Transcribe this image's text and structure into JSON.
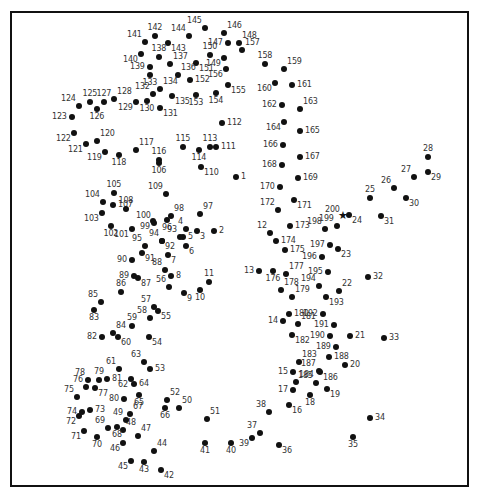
{
  "colors": {
    "dot": "#111111",
    "label": "#333333",
    "border": "#111111",
    "background": "#ffffff"
  },
  "start_marker": {
    "number": "200",
    "icon": "star-icon",
    "glyph": "★"
  },
  "points": [
    {
      "n": "1",
      "x": 236,
      "y": 177,
      "lp": "r"
    },
    {
      "n": "2",
      "x": 214,
      "y": 231,
      "lp": "r"
    },
    {
      "n": "3",
      "x": 197,
      "y": 231,
      "lp": "br"
    },
    {
      "n": "4",
      "x": 186,
      "y": 229,
      "lp": "tl"
    },
    {
      "n": "5",
      "x": 183,
      "y": 237,
      "lp": "r"
    },
    {
      "n": "6",
      "x": 186,
      "y": 246,
      "lp": "br"
    },
    {
      "n": "7",
      "x": 168,
      "y": 255,
      "lp": "br"
    },
    {
      "n": "8",
      "x": 171,
      "y": 276,
      "lp": "r"
    },
    {
      "n": "9",
      "x": 184,
      "y": 293,
      "lp": "br"
    },
    {
      "n": "10",
      "x": 200,
      "y": 290,
      "lp": "b"
    },
    {
      "n": "11",
      "x": 209,
      "y": 282,
      "lp": "t"
    },
    {
      "n": "12",
      "x": 270,
      "y": 233,
      "lp": "tl"
    },
    {
      "n": "13",
      "x": 259,
      "y": 271,
      "lp": "l"
    },
    {
      "n": "14",
      "x": 283,
      "y": 321,
      "lp": "l"
    },
    {
      "n": "15",
      "x": 293,
      "y": 372,
      "lp": "l"
    },
    {
      "n": "16",
      "x": 289,
      "y": 405,
      "lp": "br"
    },
    {
      "n": "17",
      "x": 293,
      "y": 390,
      "lp": "l"
    },
    {
      "n": "18",
      "x": 310,
      "y": 395,
      "lp": "b"
    },
    {
      "n": "19",
      "x": 327,
      "y": 389,
      "lp": "br"
    },
    {
      "n": "20",
      "x": 345,
      "y": 365,
      "lp": "r"
    },
    {
      "n": "21",
      "x": 350,
      "y": 336,
      "lp": "r"
    },
    {
      "n": "22",
      "x": 339,
      "y": 291,
      "lp": "tr"
    },
    {
      "n": "23",
      "x": 338,
      "y": 249,
      "lp": "br"
    },
    {
      "n": "24",
      "x": 349,
      "y": 215,
      "lp": "br"
    },
    {
      "n": "25",
      "x": 370,
      "y": 198,
      "lp": "t"
    },
    {
      "n": "26",
      "x": 394,
      "y": 188,
      "lp": "tl"
    },
    {
      "n": "27",
      "x": 414,
      "y": 177,
      "lp": "tl"
    },
    {
      "n": "28",
      "x": 428,
      "y": 157,
      "lp": "t"
    },
    {
      "n": "29",
      "x": 428,
      "y": 172,
      "lp": "br"
    },
    {
      "n": "30",
      "x": 406,
      "y": 198,
      "lp": "br"
    },
    {
      "n": "31",
      "x": 381,
      "y": 216,
      "lp": "br"
    },
    {
      "n": "32",
      "x": 368,
      "y": 277,
      "lp": "r"
    },
    {
      "n": "33",
      "x": 384,
      "y": 338,
      "lp": "r"
    },
    {
      "n": "34",
      "x": 370,
      "y": 418,
      "lp": "r"
    },
    {
      "n": "35",
      "x": 353,
      "y": 437,
      "lp": "b"
    },
    {
      "n": "36",
      "x": 279,
      "y": 445,
      "lp": "br"
    },
    {
      "n": "37",
      "x": 260,
      "y": 433,
      "lp": "tl"
    },
    {
      "n": "38",
      "x": 269,
      "y": 412,
      "lp": "tl"
    },
    {
      "n": "39",
      "x": 252,
      "y": 438,
      "lp": "bl"
    },
    {
      "n": "40",
      "x": 231,
      "y": 443,
      "lp": "b"
    },
    {
      "n": "41",
      "x": 205,
      "y": 443,
      "lp": "b"
    },
    {
      "n": "42",
      "x": 161,
      "y": 470,
      "lp": "br"
    },
    {
      "n": "43",
      "x": 144,
      "y": 462,
      "lp": "b"
    },
    {
      "n": "44",
      "x": 154,
      "y": 451,
      "lp": "tr"
    },
    {
      "n": "45",
      "x": 131,
      "y": 461,
      "lp": "bl"
    },
    {
      "n": "46",
      "x": 123,
      "y": 443,
      "lp": "bl"
    },
    {
      "n": "47",
      "x": 138,
      "y": 436,
      "lp": "tr"
    },
    {
      "n": "48",
      "x": 123,
      "y": 430,
      "lp": "tr"
    },
    {
      "n": "49",
      "x": 126,
      "y": 420,
      "lp": "tl"
    },
    {
      "n": "50",
      "x": 179,
      "y": 408,
      "lp": "tr"
    },
    {
      "n": "51",
      "x": 207,
      "y": 419,
      "lp": "tr"
    },
    {
      "n": "52",
      "x": 167,
      "y": 400,
      "lp": "tr"
    },
    {
      "n": "53",
      "x": 150,
      "y": 369,
      "lp": "r"
    },
    {
      "n": "54",
      "x": 149,
      "y": 337,
      "lp": "br"
    },
    {
      "n": "55",
      "x": 158,
      "y": 311,
      "lp": "br"
    },
    {
      "n": "56",
      "x": 169,
      "y": 287,
      "lp": "tl"
    },
    {
      "n": "57",
      "x": 154,
      "y": 307,
      "lp": "tl"
    },
    {
      "n": "58",
      "x": 150,
      "y": 318,
      "lp": "tl"
    },
    {
      "n": "59",
      "x": 132,
      "y": 326,
      "lp": "t"
    },
    {
      "n": "60",
      "x": 118,
      "y": 337,
      "lp": "br"
    },
    {
      "n": "61",
      "x": 119,
      "y": 369,
      "lp": "tl"
    },
    {
      "n": "62",
      "x": 131,
      "y": 379,
      "lp": "bl"
    },
    {
      "n": "63",
      "x": 144,
      "y": 362,
      "lp": "tl"
    },
    {
      "n": "64",
      "x": 134,
      "y": 384,
      "lp": "r"
    },
    {
      "n": "65",
      "x": 139,
      "y": 395,
      "lp": "b"
    },
    {
      "n": "66",
      "x": 165,
      "y": 408,
      "lp": "b"
    },
    {
      "n": "67",
      "x": 130,
      "y": 414,
      "lp": "tr"
    },
    {
      "n": "68",
      "x": 117,
      "y": 427,
      "lp": "b"
    },
    {
      "n": "69",
      "x": 108,
      "y": 428,
      "lp": "tl"
    },
    {
      "n": "70",
      "x": 97,
      "y": 437,
      "lp": "b"
    },
    {
      "n": "71",
      "x": 84,
      "y": 431,
      "lp": "bl"
    },
    {
      "n": "72",
      "x": 79,
      "y": 416,
      "lp": "bl"
    },
    {
      "n": "73",
      "x": 90,
      "y": 410,
      "lp": "r"
    },
    {
      "n": "74",
      "x": 82,
      "y": 412,
      "lp": "l"
    },
    {
      "n": "75",
      "x": 77,
      "y": 397,
      "lp": "tl"
    },
    {
      "n": "76",
      "x": 86,
      "y": 387,
      "lp": "tl"
    },
    {
      "n": "77",
      "x": 95,
      "y": 388,
      "lp": "br"
    },
    {
      "n": "78",
      "x": 88,
      "y": 380,
      "lp": "tl"
    },
    {
      "n": "79",
      "x": 99,
      "y": 380,
      "lp": "t"
    },
    {
      "n": "80",
      "x": 124,
      "y": 399,
      "lp": "l"
    },
    {
      "n": "81",
      "x": 107,
      "y": 379,
      "lp": "r"
    },
    {
      "n": "82",
      "x": 102,
      "y": 337,
      "lp": "l"
    },
    {
      "n": "83",
      "x": 94,
      "y": 310,
      "lp": "b"
    },
    {
      "n": "84",
      "x": 113,
      "y": 333,
      "lp": "tr"
    },
    {
      "n": "85",
      "x": 101,
      "y": 302,
      "lp": "tl"
    },
    {
      "n": "86",
      "x": 121,
      "y": 292,
      "lp": "t"
    },
    {
      "n": "87",
      "x": 138,
      "y": 278,
      "lp": "br"
    },
    {
      "n": "88",
      "x": 165,
      "y": 270,
      "lp": "tl"
    },
    {
      "n": "89",
      "x": 134,
      "y": 276,
      "lp": "l"
    },
    {
      "n": "90",
      "x": 132,
      "y": 260,
      "lp": "l"
    },
    {
      "n": "91",
      "x": 142,
      "y": 253,
      "lp": "br"
    },
    {
      "n": "92",
      "x": 162,
      "y": 241,
      "lp": "br"
    },
    {
      "n": "93",
      "x": 180,
      "y": 237,
      "lp": "tl"
    },
    {
      "n": "94",
      "x": 162,
      "y": 241,
      "lp": "tl"
    },
    {
      "n": "95",
      "x": 145,
      "y": 246,
      "lp": "tl"
    },
    {
      "n": "96",
      "x": 167,
      "y": 220,
      "lp": "b"
    },
    {
      "n": "97",
      "x": 200,
      "y": 214,
      "lp": "tr"
    },
    {
      "n": "98",
      "x": 171,
      "y": 216,
      "lp": "tr"
    },
    {
      "n": "99",
      "x": 153,
      "y": 221,
      "lp": "bl"
    },
    {
      "n": "100",
      "x": 154,
      "y": 223,
      "lp": "tl"
    },
    {
      "n": "101",
      "x": 132,
      "y": 229,
      "lp": "bl"
    },
    {
      "n": "102",
      "x": 111,
      "y": 226,
      "lp": "b"
    },
    {
      "n": "103",
      "x": 102,
      "y": 213,
      "lp": "bl"
    },
    {
      "n": "104",
      "x": 103,
      "y": 202,
      "lp": "tl"
    },
    {
      "n": "105",
      "x": 114,
      "y": 193,
      "lp": "t"
    },
    {
      "n": "106",
      "x": 159,
      "y": 163,
      "lp": "b"
    },
    {
      "n": "107",
      "x": 113,
      "y": 205,
      "lp": "r"
    },
    {
      "n": "108",
      "x": 126,
      "y": 209,
      "lp": "t"
    },
    {
      "n": "109",
      "x": 166,
      "y": 194,
      "lp": "tl"
    },
    {
      "n": "110",
      "x": 201,
      "y": 167,
      "lp": "br"
    },
    {
      "n": "111",
      "x": 216,
      "y": 147,
      "lp": "r"
    },
    {
      "n": "112",
      "x": 222,
      "y": 123,
      "lp": "r"
    },
    {
      "n": "113",
      "x": 210,
      "y": 147,
      "lp": "t"
    },
    {
      "n": "114",
      "x": 199,
      "y": 150,
      "lp": "b"
    },
    {
      "n": "115",
      "x": 183,
      "y": 147,
      "lp": "t"
    },
    {
      "n": "116",
      "x": 159,
      "y": 160,
      "lp": "t"
    },
    {
      "n": "117",
      "x": 136,
      "y": 150,
      "lp": "tr"
    },
    {
      "n": "118",
      "x": 119,
      "y": 155,
      "lp": "b"
    },
    {
      "n": "119",
      "x": 105,
      "y": 152,
      "lp": "bl"
    },
    {
      "n": "120",
      "x": 97,
      "y": 141,
      "lp": "tr"
    },
    {
      "n": "121",
      "x": 86,
      "y": 144,
      "lp": "bl"
    },
    {
      "n": "122",
      "x": 74,
      "y": 133,
      "lp": "bl"
    },
    {
      "n": "123",
      "x": 72,
      "y": 117,
      "lp": "l"
    },
    {
      "n": "124",
      "x": 79,
      "y": 106,
      "lp": "tl"
    },
    {
      "n": "125",
      "x": 90,
      "y": 102,
      "lp": "t"
    },
    {
      "n": "126",
      "x": 97,
      "y": 109,
      "lp": "b"
    },
    {
      "n": "127",
      "x": 104,
      "y": 102,
      "lp": "t"
    },
    {
      "n": "128",
      "x": 114,
      "y": 99,
      "lp": "tr"
    },
    {
      "n": "129",
      "x": 136,
      "y": 102,
      "lp": "bl"
    },
    {
      "n": "130",
      "x": 147,
      "y": 101,
      "lp": "b"
    },
    {
      "n": "131",
      "x": 160,
      "y": 108,
      "lp": "br"
    },
    {
      "n": "132",
      "x": 153,
      "y": 94,
      "lp": "tl"
    },
    {
      "n": "133",
      "x": 150,
      "y": 75,
      "lp": "b"
    },
    {
      "n": "134",
      "x": 160,
      "y": 89,
      "lp": "tr"
    },
    {
      "n": "135",
      "x": 172,
      "y": 96,
      "lp": "br"
    },
    {
      "n": "136",
      "x": 178,
      "y": 75,
      "lp": "tr"
    },
    {
      "n": "137",
      "x": 170,
      "y": 64,
      "lp": "tr"
    },
    {
      "n": "138",
      "x": 159,
      "y": 57,
      "lp": "t"
    },
    {
      "n": "139",
      "x": 150,
      "y": 67,
      "lp": "l"
    },
    {
      "n": "140",
      "x": 141,
      "y": 54,
      "lp": "bl"
    },
    {
      "n": "141",
      "x": 145,
      "y": 42,
      "lp": "tl"
    },
    {
      "n": "142",
      "x": 155,
      "y": 36,
      "lp": "t"
    },
    {
      "n": "143",
      "x": 168,
      "y": 43,
      "lp": "br"
    },
    {
      "n": "144",
      "x": 189,
      "y": 36,
      "lp": "tl"
    },
    {
      "n": "145",
      "x": 205,
      "y": 28,
      "lp": "tl"
    },
    {
      "n": "146",
      "x": 224,
      "y": 33,
      "lp": "tr"
    },
    {
      "n": "147",
      "x": 228,
      "y": 43,
      "lp": "l"
    },
    {
      "n": "148",
      "x": 239,
      "y": 43,
      "lp": "tr"
    },
    {
      "n": "149",
      "x": 224,
      "y": 58,
      "lp": "bl"
    },
    {
      "n": "150",
      "x": 210,
      "y": 55,
      "lp": "t"
    },
    {
      "n": "151",
      "x": 196,
      "y": 63,
      "lp": "br"
    },
    {
      "n": "152",
      "x": 190,
      "y": 80,
      "lp": "r"
    },
    {
      "n": "153",
      "x": 196,
      "y": 95,
      "lp": "b"
    },
    {
      "n": "154",
      "x": 216,
      "y": 93,
      "lp": "b"
    },
    {
      "n": "155",
      "x": 228,
      "y": 85,
      "lp": "br"
    },
    {
      "n": "156",
      "x": 226,
      "y": 69,
      "lp": "bl"
    },
    {
      "n": "157",
      "x": 242,
      "y": 50,
      "lp": "tr"
    },
    {
      "n": "158",
      "x": 265,
      "y": 64,
      "lp": "t"
    },
    {
      "n": "159",
      "x": 284,
      "y": 69,
      "lp": "tr"
    },
    {
      "n": "160",
      "x": 275,
      "y": 83,
      "lp": "bl"
    },
    {
      "n": "161",
      "x": 292,
      "y": 85,
      "lp": "r"
    },
    {
      "n": "162",
      "x": 282,
      "y": 105,
      "lp": "l"
    },
    {
      "n": "163",
      "x": 300,
      "y": 109,
      "lp": "tr"
    },
    {
      "n": "164",
      "x": 284,
      "y": 122,
      "lp": "bl"
    },
    {
      "n": "165",
      "x": 300,
      "y": 131,
      "lp": "r"
    },
    {
      "n": "166",
      "x": 283,
      "y": 145,
      "lp": "l"
    },
    {
      "n": "167",
      "x": 300,
      "y": 157,
      "lp": "r"
    },
    {
      "n": "168",
      "x": 282,
      "y": 165,
      "lp": "l"
    },
    {
      "n": "169",
      "x": 298,
      "y": 178,
      "lp": "r"
    },
    {
      "n": "170",
      "x": 280,
      "y": 187,
      "lp": "l"
    },
    {
      "n": "171",
      "x": 294,
      "y": 200,
      "lp": "br"
    },
    {
      "n": "172",
      "x": 278,
      "y": 210,
      "lp": "tl"
    },
    {
      "n": "173",
      "x": 290,
      "y": 226,
      "lp": "r"
    },
    {
      "n": "174",
      "x": 276,
      "y": 241,
      "lp": "r"
    },
    {
      "n": "175",
      "x": 285,
      "y": 250,
      "lp": "r"
    },
    {
      "n": "176",
      "x": 273,
      "y": 271,
      "lp": "b"
    },
    {
      "n": "177",
      "x": 286,
      "y": 274,
      "lp": "tr"
    },
    {
      "n": "178",
      "x": 281,
      "y": 290,
      "lp": "tr"
    },
    {
      "n": "179",
      "x": 292,
      "y": 297,
      "lp": "tr"
    },
    {
      "n": "180",
      "x": 289,
      "y": 314,
      "lp": "r"
    },
    {
      "n": "181",
      "x": 298,
      "y": 324,
      "lp": "tr"
    },
    {
      "n": "182",
      "x": 292,
      "y": 335,
      "lp": "br"
    },
    {
      "n": "183",
      "x": 299,
      "y": 362,
      "lp": "tr"
    },
    {
      "n": "184",
      "x": 296,
      "y": 382,
      "lp": "tr"
    },
    {
      "n": "185",
      "x": 316,
      "y": 383,
      "lp": "tl"
    },
    {
      "n": "186",
      "x": 320,
      "y": 372,
      "lp": "br"
    },
    {
      "n": "187",
      "x": 319,
      "y": 371,
      "lp": "tl"
    },
    {
      "n": "188",
      "x": 329,
      "y": 357,
      "lp": "r"
    },
    {
      "n": "189",
      "x": 336,
      "y": 347,
      "lp": "l"
    },
    {
      "n": "190",
      "x": 330,
      "y": 336,
      "lp": "l"
    },
    {
      "n": "191",
      "x": 334,
      "y": 325,
      "lp": "l"
    },
    {
      "n": "192",
      "x": 323,
      "y": 314,
      "lp": "l"
    },
    {
      "n": "193",
      "x": 326,
      "y": 297,
      "lp": "br"
    },
    {
      "n": "194",
      "x": 319,
      "y": 286,
      "lp": "tl"
    },
    {
      "n": "195",
      "x": 328,
      "y": 272,
      "lp": "l"
    },
    {
      "n": "196",
      "x": 322,
      "y": 257,
      "lp": "l"
    },
    {
      "n": "197",
      "x": 330,
      "y": 245,
      "lp": "l"
    },
    {
      "n": "198",
      "x": 325,
      "y": 229,
      "lp": "tl"
    },
    {
      "n": "199",
      "x": 337,
      "y": 226,
      "lp": "tl"
    },
    {
      "n": "200",
      "x": 343,
      "y": 217,
      "lp": "tl",
      "star": true
    }
  ]
}
